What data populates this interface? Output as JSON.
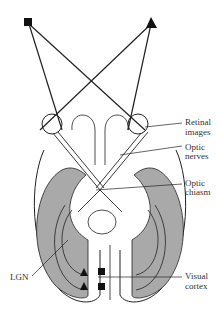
{
  "diagram": {
    "type": "visual-pathway",
    "labels": {
      "retinal_images_1": "Retinal",
      "retinal_images_2": "images",
      "optic_nerves_1": "Optic",
      "optic_nerves_2": "nerves",
      "optic_chiasm_1": "Optic",
      "optic_chiasm_2": "chiasm",
      "lgn": "LGN",
      "visual_cortex_1": "Visual",
      "visual_cortex_2": "cortex"
    },
    "objects": [
      "square",
      "triangle"
    ],
    "colors": {
      "cortex": "#a9a9a9",
      "line": "#222222",
      "background": "#ffffff"
    }
  }
}
